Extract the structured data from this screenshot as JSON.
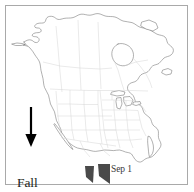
{
  "figure": {
    "name": "north-america-fall-migration-map",
    "width": 194,
    "height": 192,
    "background_color": "#ffffff",
    "frame_color": "#a9a9a9"
  },
  "map": {
    "region": "North America",
    "coastline_color": "#6e6e6e",
    "boundary_color": "#d3d3d3",
    "fill_color": "#ffffff",
    "features": [
      "Alaska",
      "Canada",
      "Hudson Bay",
      "Great Lakes",
      "Contiguous United States",
      "Baja California",
      "Mexico",
      "Florida",
      "Gulf of Mexico"
    ]
  },
  "annotations": {
    "arrow": {
      "name": "fall-migration-arrow",
      "direction": "down",
      "color": "#000000"
    },
    "migration_label": {
      "line1": "Fall",
      "line2": "Migration",
      "color": "#231f20"
    },
    "date_label": {
      "text": "Sep 1",
      "color": "#3a3a3a"
    },
    "range_markers": {
      "name": "migration-range-wedges",
      "count": 2,
      "color": "#4a4a4a",
      "description": "two dark wedge markers along southern route"
    }
  }
}
